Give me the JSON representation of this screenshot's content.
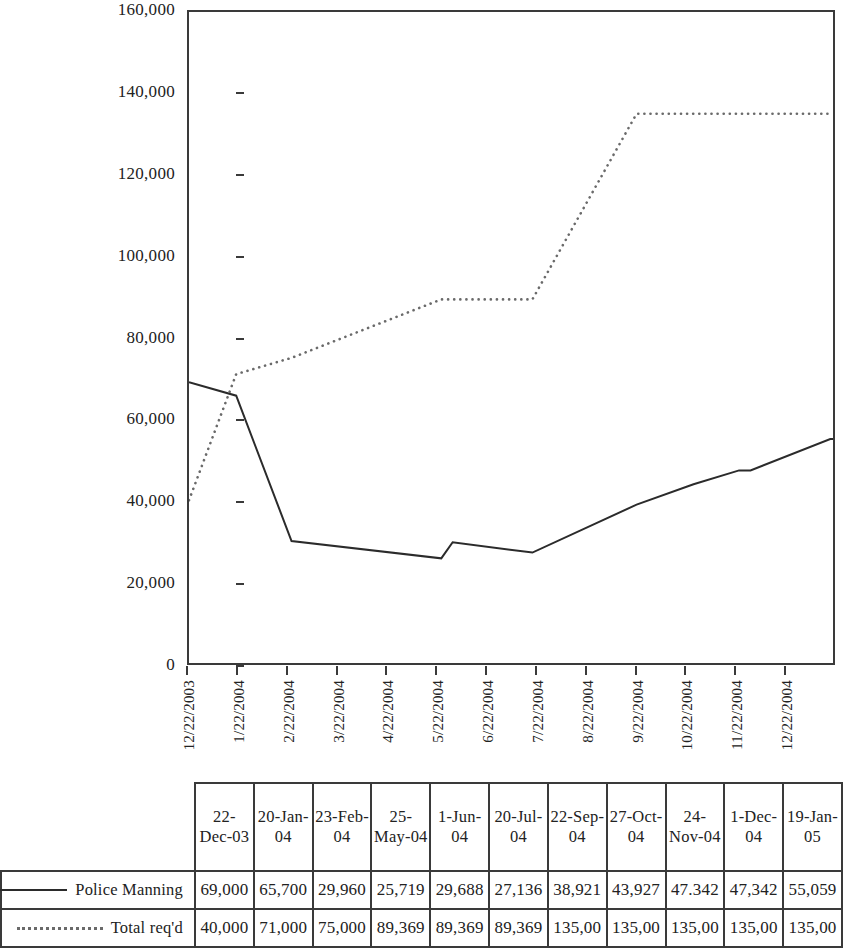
{
  "chart_data": {
    "type": "line",
    "title": "",
    "xlabel": "",
    "ylabel": "",
    "ylim": [
      0,
      160000
    ],
    "grid": false,
    "legend_position": "table-left",
    "y_ticks": [
      "0",
      "20,000",
      "40,000",
      "60,000",
      "80,000",
      "100,000",
      "120,000",
      "140,000",
      "160,000"
    ],
    "y_tick_values": [
      0,
      20000,
      40000,
      60000,
      80000,
      100000,
      120000,
      140000,
      160000
    ],
    "x_tick_labels": [
      "12/22/2003",
      "1/22/2004",
      "2/22/2004",
      "3/22/2004",
      "4/22/2004",
      "5/22/2004",
      "6/22/2004",
      "7/22/2004",
      "8/22/2004",
      "9/22/2004",
      "10/22/2004",
      "11/22/2004",
      "12/22/2004"
    ],
    "categories": [
      "22-Dec-03",
      "20-Jan-04",
      "23-Feb-04",
      "25-May-04",
      "1-Jun-04",
      "20-Jul-04",
      "22-Sep-04",
      "27-Oct-04",
      "24-Nov-04",
      "1-Dec-04",
      "19-Jan-05"
    ],
    "x_dates": [
      "2003-12-22",
      "2004-01-20",
      "2004-02-23",
      "2004-05-25",
      "2004-06-01",
      "2004-07-20",
      "2004-09-22",
      "2004-10-27",
      "2004-11-24",
      "2004-12-01",
      "2005-01-19"
    ],
    "series": [
      {
        "name": "Police Manning",
        "style": "solid",
        "color": "#2b2b2b",
        "values": [
          69000,
          65700,
          29960,
          25719,
          29688,
          27136,
          38921,
          43927,
          47342,
          47342,
          55059
        ]
      },
      {
        "name": "Total req'd",
        "style": "dotted",
        "color": "#6a6a6a",
        "values": [
          40000,
          71000,
          75000,
          89369,
          89369,
          89369,
          135000,
          135000,
          135000,
          135000,
          135000
        ]
      }
    ]
  },
  "table": {
    "header": [
      "22-Dec-03",
      "20-Jan-04",
      "23-Feb-04",
      "25-May-04",
      "1-Jun-04",
      "20-Jul-04",
      "22-Sep-04",
      "27-Oct-04",
      "24-Nov-04",
      "1-Dec-04",
      "19-Jan-05"
    ],
    "rows": [
      {
        "label": "Police Manning",
        "style": "solid",
        "cells": [
          "69,000",
          "65,700",
          "29,960",
          "25,719",
          "29,688",
          "27,136",
          "38,921",
          "43,927",
          "47.342",
          "47,342",
          "55,059"
        ]
      },
      {
        "label": "Total req'd",
        "style": "dotted",
        "cells": [
          "40,000",
          "71,000",
          "75,000",
          "89,369",
          "89,369",
          "89,369",
          "135,00",
          "135,00",
          "135,00",
          "135,00",
          "135,00"
        ]
      }
    ]
  },
  "colors": {
    "axis": "#3a3a3a",
    "series_solid": "#2b2b2b",
    "series_dotted": "#6a6a6a",
    "background": "#ffffff"
  }
}
